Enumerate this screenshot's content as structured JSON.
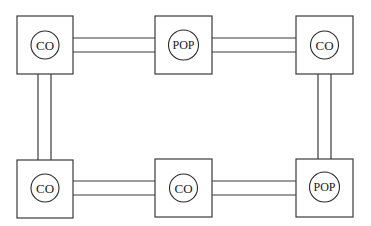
{
  "diagram": {
    "type": "network-ring",
    "colors": {
      "stroke": "#3a3a3a",
      "background": "#ffffff"
    },
    "nodes": [
      {
        "id": "top-left",
        "label": "CO",
        "row": 0,
        "col": 0
      },
      {
        "id": "top-middle",
        "label": "POP",
        "row": 0,
        "col": 1
      },
      {
        "id": "top-right",
        "label": "CO",
        "row": 0,
        "col": 2
      },
      {
        "id": "bottom-left",
        "label": "CO",
        "row": 1,
        "col": 0
      },
      {
        "id": "bottom-middle",
        "label": "CO",
        "row": 1,
        "col": 1
      },
      {
        "id": "bottom-right",
        "label": "POP",
        "row": 1,
        "col": 2
      }
    ],
    "links": [
      {
        "from": "top-left",
        "to": "top-middle"
      },
      {
        "from": "top-middle",
        "to": "top-right"
      },
      {
        "from": "top-left",
        "to": "bottom-left"
      },
      {
        "from": "top-right",
        "to": "bottom-right"
      },
      {
        "from": "bottom-left",
        "to": "bottom-middle"
      },
      {
        "from": "bottom-middle",
        "to": "bottom-right"
      }
    ]
  }
}
